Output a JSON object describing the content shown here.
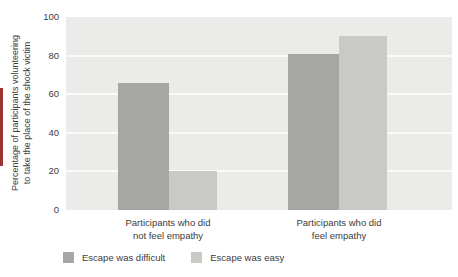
{
  "accent_color": "#9c3434",
  "text_color": "#3c3c3c",
  "chart_data": {
    "type": "bar",
    "title": "",
    "ylabel_lines": [
      "Percentage of participants volunteering",
      "to take the place of the shock victim"
    ],
    "categories": [
      {
        "lines": [
          "Participants who did",
          "not feel empathy"
        ]
      },
      {
        "lines": [
          "Participants who did",
          "feel empathy"
        ]
      }
    ],
    "series": [
      {
        "name": "Escape was difficult",
        "color": "#a6a6a4",
        "values": [
          66,
          81
        ]
      },
      {
        "name": "Escape was easy",
        "color": "#c9cac6",
        "values": [
          20,
          90
        ]
      }
    ],
    "ylim": [
      0,
      100
    ],
    "yticks": [
      0,
      20,
      40,
      60,
      80,
      100
    ],
    "grid": true,
    "legend_position": "bottom",
    "plot_bg": "#ebebe9",
    "gridline_color": "#fafaf8"
  }
}
